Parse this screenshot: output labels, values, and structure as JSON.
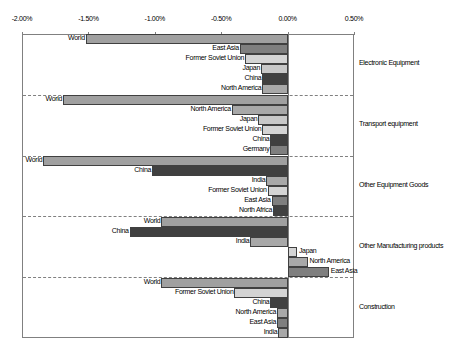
{
  "chart_data": {
    "type": "bar",
    "orientation": "horizontal",
    "title": "",
    "xlabel": "",
    "ylabel": "",
    "xlim": [
      -0.02,
      0.005
    ],
    "x_ticks": [
      "-2.00%",
      "-1.50%",
      "-1.00%",
      "-0.50%",
      "0.00%",
      "0.50%"
    ],
    "grid": false,
    "legend": null,
    "groups": [
      {
        "name": "Electronic Equipment",
        "bars": [
          {
            "label": "World",
            "value": -1.52,
            "color": "#a0a0a0"
          },
          {
            "label": "East Asia",
            "value": -0.36,
            "color": "#7f7f7f"
          },
          {
            "label": "Former Soviet Union",
            "value": -0.32,
            "color": "#d4d4d4"
          },
          {
            "label": "Japan",
            "value": -0.2,
            "color": "#c8c8c8"
          },
          {
            "label": "China",
            "value": -0.19,
            "color": "#404040"
          },
          {
            "label": "North America",
            "value": -0.19,
            "color": "#a8a8a8"
          }
        ]
      },
      {
        "name": "Transport equipment",
        "bars": [
          {
            "label": "World",
            "value": -1.69,
            "color": "#a0a0a0"
          },
          {
            "label": "North America",
            "value": -0.42,
            "color": "#a8a8a8"
          },
          {
            "label": "Japan",
            "value": -0.22,
            "color": "#c8c8c8"
          },
          {
            "label": "Former Soviet Union",
            "value": -0.19,
            "color": "#d4d4d4"
          },
          {
            "label": "China",
            "value": -0.13,
            "color": "#404040"
          },
          {
            "label": "Germany",
            "value": -0.13,
            "color": "#7f7f7f"
          }
        ]
      },
      {
        "name": "Other Equipment Goods",
        "bars": [
          {
            "label": "World",
            "value": -1.84,
            "color": "#a0a0a0"
          },
          {
            "label": "China",
            "value": -1.02,
            "color": "#404040"
          },
          {
            "label": "India",
            "value": -0.16,
            "color": "#a8a8a8"
          },
          {
            "label": "Former Soviet Union",
            "value": -0.15,
            "color": "#d4d4d4"
          },
          {
            "label": "East Asia",
            "value": -0.12,
            "color": "#7f7f7f"
          },
          {
            "label": "North Africa",
            "value": -0.11,
            "color": "#404040"
          }
        ]
      },
      {
        "name": "Other Manufacturing products",
        "bars": [
          {
            "label": "World",
            "value": -0.95,
            "color": "#a0a0a0"
          },
          {
            "label": "China",
            "value": -1.19,
            "color": "#404040"
          },
          {
            "label": "India",
            "value": -0.28,
            "color": "#a8a8a8"
          },
          {
            "label": "Japan",
            "value": 0.07,
            "color": "#d4d4d4"
          },
          {
            "label": "North America",
            "value": 0.15,
            "color": "#a8a8a8"
          },
          {
            "label": "East Asia",
            "value": 0.31,
            "color": "#7f7f7f"
          }
        ]
      },
      {
        "name": "Construction",
        "bars": [
          {
            "label": "World",
            "value": -0.95,
            "color": "#a0a0a0"
          },
          {
            "label": "Former Soviet Union",
            "value": -0.4,
            "color": "#d4d4d4"
          },
          {
            "label": "China",
            "value": -0.13,
            "color": "#404040"
          },
          {
            "label": "North America",
            "value": -0.08,
            "color": "#a8a8a8"
          },
          {
            "label": "East Asia",
            "value": -0.08,
            "color": "#7f7f7f"
          },
          {
            "label": "India",
            "value": -0.07,
            "color": "#a8a8a8"
          }
        ]
      }
    ]
  }
}
